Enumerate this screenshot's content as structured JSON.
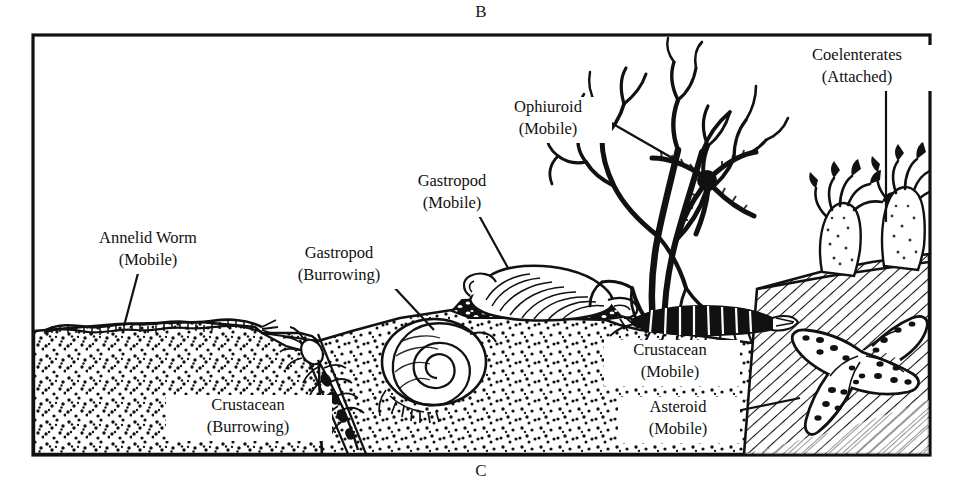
{
  "figure": {
    "caption_top": "B",
    "caption_bottom": "C",
    "frame": {
      "x": 33,
      "y": 35,
      "width": 897,
      "height": 420,
      "border_color": "#111111"
    },
    "background_color": "#ffffff",
    "ink_color": "#111111",
    "scene_description": "Cross-section diagram of a marine benthic sea-floor habitat showing soft sediment, a rocky slope, and associated invertebrate fauna with labelled leader lines"
  },
  "labels": [
    {
      "id": "annelid-worm",
      "line1": "Annelid Worm",
      "line2": "(Mobile)",
      "text_x": 148,
      "text_y": 243,
      "anchor": "middle",
      "leader": {
        "x1": 141,
        "y1": 262,
        "x2": 124,
        "y2": 326
      }
    },
    {
      "id": "gastropod-burrowing",
      "line1": "Gastropod",
      "line2": "(Burrowing)",
      "text_x": 339,
      "text_y": 258,
      "anchor": "middle",
      "leader": {
        "x1": 392,
        "y1": 285,
        "x2": 434,
        "y2": 330
      }
    },
    {
      "id": "gastropod-mobile",
      "line1": "Gastropod",
      "line2": "(Mobile)",
      "text_x": 452,
      "text_y": 186,
      "anchor": "middle",
      "leader": {
        "x1": 476,
        "y1": 210,
        "x2": 508,
        "y2": 268
      }
    },
    {
      "id": "ophiuroid",
      "line1": "Ophiuroid",
      "line2": "(Mobile)",
      "text_x": 548,
      "text_y": 112,
      "anchor": "middle",
      "leader": {
        "x1": 594,
        "y1": 113,
        "x2": 707,
        "y2": 178
      }
    },
    {
      "id": "coelenterates",
      "line1": "Coelenterates",
      "line2": "(Attached)",
      "text_x": 857,
      "text_y": 60,
      "anchor": "middle",
      "leader": {
        "x1": 886,
        "y1": 86,
        "x2": 886,
        "y2": 222
      }
    },
    {
      "id": "crustacean-mobile",
      "line1": "Crustacean",
      "line2": "(Mobile)",
      "text_x": 670,
      "text_y": 355,
      "anchor": "middle",
      "leader": null
    },
    {
      "id": "asteroid",
      "line1": "Asteroid",
      "line2": "(Mobile)",
      "text_x": 678,
      "text_y": 412,
      "anchor": "middle",
      "leader": {
        "x1": 722,
        "y1": 414,
        "x2": 800,
        "y2": 398
      }
    },
    {
      "id": "crustacean-burrowing",
      "line1": "Crustacean",
      "line2": "(Burrowing)",
      "text_x": 248,
      "text_y": 410,
      "anchor": "middle",
      "leader": null
    }
  ],
  "organisms": [
    {
      "id": "annelid-worm",
      "name": "Annelid Worm",
      "mobility": "Mobile",
      "habit": "surface crawler on sediment"
    },
    {
      "id": "gastropod-burrowing",
      "name": "Gastropod",
      "mobility": "Burrowing",
      "habit": "spiral shell within sediment"
    },
    {
      "id": "gastropod-mobile",
      "name": "Gastropod",
      "mobility": "Mobile",
      "habit": "shell resting on cobble bed"
    },
    {
      "id": "ophiuroid",
      "name": "Ophiuroid",
      "mobility": "Mobile",
      "habit": "brittle star clinging to gorgonian"
    },
    {
      "id": "coelenterates",
      "name": "Coelenterates",
      "mobility": "Attached",
      "habit": "sea anemones fixed to rock"
    },
    {
      "id": "crustacean-mobile",
      "name": "Crustacean",
      "mobility": "Mobile",
      "habit": "segmented shrimp walking on sediment"
    },
    {
      "id": "asteroid",
      "name": "Asteroid",
      "mobility": "Mobile",
      "habit": "sea star on hatched rock slope"
    },
    {
      "id": "crustacean-burrowing",
      "name": "Crustacean",
      "mobility": "Burrowing",
      "habit": "within an oblique sediment burrow"
    }
  ],
  "substrates": [
    {
      "id": "soft-sediment",
      "texture": "stipple",
      "description": "sand / mud soft bottom"
    },
    {
      "id": "rocky-slope",
      "texture": "diagonal-hatch",
      "description": "hard rocky substrate at right"
    },
    {
      "id": "cobble-bed",
      "texture": "dark-pebble",
      "description": "dark coarse gravel beneath mobile gastropod"
    }
  ]
}
